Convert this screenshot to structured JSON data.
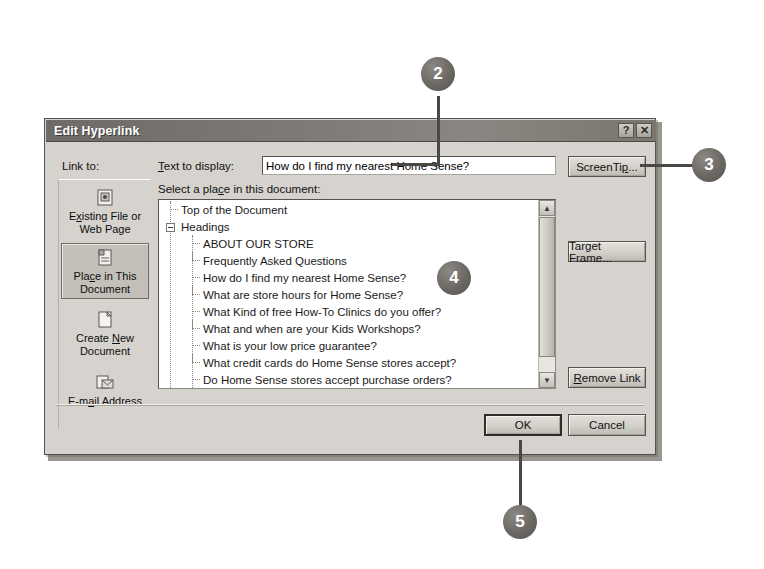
{
  "dialog": {
    "title": "Edit Hyperlink",
    "help_button": "?",
    "close_button": "✕",
    "link_to_label": "Link to:",
    "text_to_display_label": "Text to display:",
    "text_to_display_value": "How do I find my nearest Home Sense?",
    "select_place_label": "Select a place in this document:"
  },
  "sidebar": {
    "items": [
      {
        "label_part1": "E",
        "accel": "x",
        "label_part2": "isting File or",
        "label_line2": "Web Page",
        "icon": "existing-file-icon",
        "selected": false
      },
      {
        "label_part1": "Pla",
        "accel": "c",
        "label_part2": "e in This",
        "label_line2": "Document",
        "icon": "place-in-document-icon",
        "selected": true
      },
      {
        "label_part1": "Create ",
        "accel": "N",
        "label_part2": "ew",
        "label_line2": "Document",
        "icon": "create-new-document-icon",
        "selected": false
      },
      {
        "label_part1": "E-m",
        "accel": "a",
        "label_part2": "il Address",
        "label_line2": "",
        "icon": "email-address-icon",
        "selected": false
      }
    ]
  },
  "list": {
    "items": [
      {
        "text": "Top of the Document",
        "level": 1,
        "expander": false
      },
      {
        "text": "Headings",
        "level": 0,
        "expander": true
      },
      {
        "text": "ABOUT OUR STORE",
        "level": 2,
        "expander": false
      },
      {
        "text": "Frequently Asked Questions",
        "level": 2,
        "expander": false
      },
      {
        "text": "How do I find my nearest Home Sense?",
        "level": 2,
        "expander": false
      },
      {
        "text": "What are store hours for Home Sense?",
        "level": 2,
        "expander": false
      },
      {
        "text": "What Kind of free How-To Clinics do you offer?",
        "level": 2,
        "expander": false
      },
      {
        "text": "What and when are your Kids Workshops?",
        "level": 2,
        "expander": false
      },
      {
        "text": "What is your low price guarantee?",
        "level": 2,
        "expander": false
      },
      {
        "text": "What credit cards do Home Sense stores accept?",
        "level": 2,
        "expander": false
      },
      {
        "text": "Do Home Sense stores accept purchase orders?",
        "level": 2,
        "expander": false
      },
      {
        "text": "How can I bring my store comments to your attention?",
        "level": 2,
        "expander": false
      }
    ],
    "scroll_up_glyph": "▲",
    "scroll_down_glyph": "▼"
  },
  "buttons": {
    "screentip": {
      "pre": "ScreenTi",
      "accel": "p",
      "post": "..."
    },
    "target_frame": {
      "pre": "Tar",
      "accel": "g",
      "post": "et Frame..."
    },
    "remove_link": {
      "pre": "",
      "accel": "R",
      "post": "emove Link"
    },
    "ok": "OK",
    "cancel": "Cancel"
  },
  "callouts": [
    {
      "number": "2"
    },
    {
      "number": "3"
    },
    {
      "number": "4"
    },
    {
      "number": "5"
    }
  ]
}
